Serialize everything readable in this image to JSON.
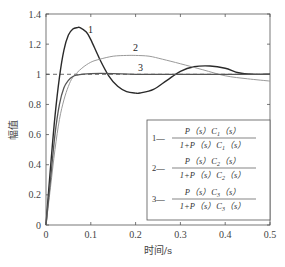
{
  "chart_data": {
    "type": "line",
    "title": "",
    "xlabel": "时间/s",
    "ylabel": "幅值",
    "xlim": [
      0,
      0.5
    ],
    "ylim": [
      0,
      1.4
    ],
    "xticks": [
      "0",
      "0.1",
      "0.2",
      "0.3",
      "0.4",
      "0.5"
    ],
    "yticks": [
      "0",
      "0.2",
      "0.4",
      "0.6",
      "0.8",
      "1",
      "1.2",
      "1.4"
    ],
    "grid": false,
    "reference_line": {
      "y": 1,
      "style": "dashed"
    },
    "legend_position": "lower right",
    "series": [
      {
        "name": "1",
        "label": "1",
        "legend": "P(s)C1(s) / (1+P(s)C1(s))",
        "color": "#2a2a2a",
        "x": [
          0,
          0.01,
          0.02,
          0.03,
          0.04,
          0.05,
          0.06,
          0.07,
          0.076,
          0.09,
          0.1,
          0.12,
          0.14,
          0.16,
          0.18,
          0.2,
          0.21,
          0.24,
          0.27,
          0.3,
          0.33,
          0.366,
          0.4,
          0.43,
          0.46,
          0.5
        ],
        "y": [
          0,
          0.38,
          0.72,
          0.98,
          1.16,
          1.26,
          1.3,
          1.31,
          1.31,
          1.28,
          1.23,
          1.1,
          0.99,
          0.92,
          0.885,
          0.875,
          0.876,
          0.9,
          0.96,
          1.02,
          1.05,
          1.055,
          1.04,
          1.01,
          1.0,
          1.0
        ]
      },
      {
        "name": "2",
        "label": "2",
        "legend": "P(s)C2(s) / (1+P(s)C2(s))",
        "color": "#9a9a9a",
        "x": [
          0,
          0.01,
          0.02,
          0.03,
          0.04,
          0.05,
          0.06,
          0.08,
          0.1,
          0.12,
          0.15,
          0.18,
          0.2,
          0.23,
          0.26,
          0.3,
          0.35,
          0.4,
          0.45,
          0.5
        ],
        "y": [
          0,
          0.25,
          0.5,
          0.7,
          0.83,
          0.92,
          0.98,
          1.04,
          1.08,
          1.1,
          1.12,
          1.125,
          1.125,
          1.12,
          1.1,
          1.07,
          1.03,
          0.99,
          0.97,
          0.955
        ]
      },
      {
        "name": "3",
        "label": "3",
        "legend": "P(s)C3(s) / (1+P(s)C3(s))",
        "color": "#555555",
        "x": [
          0,
          0.01,
          0.02,
          0.03,
          0.04,
          0.05,
          0.06,
          0.07,
          0.08,
          0.1,
          0.15,
          0.2,
          0.3,
          0.4,
          0.5
        ],
        "y": [
          0,
          0.3,
          0.6,
          0.8,
          0.91,
          0.96,
          0.985,
          0.995,
          1.0,
          1.005,
          1.005,
          1.0,
          1.0,
          1.0,
          1.0
        ]
      }
    ]
  },
  "labels": {
    "curve1": "1",
    "curve2": "2",
    "curve3": "3",
    "xlabel": "时间/s",
    "ylabel": "幅值"
  },
  "legend": {
    "items": [
      {
        "id": "1—",
        "num": "P（s）C",
        "den": "1+P（s）C",
        "sub": "1",
        "tail": "（s）"
      },
      {
        "id": "2—",
        "num": "P（s）C",
        "den": "1+P（s）C",
        "sub": "2",
        "tail": "（s）"
      },
      {
        "id": "3—",
        "num": "P（s）C",
        "den": "1+P（s）C",
        "sub": "3",
        "tail": "（s）"
      }
    ]
  }
}
